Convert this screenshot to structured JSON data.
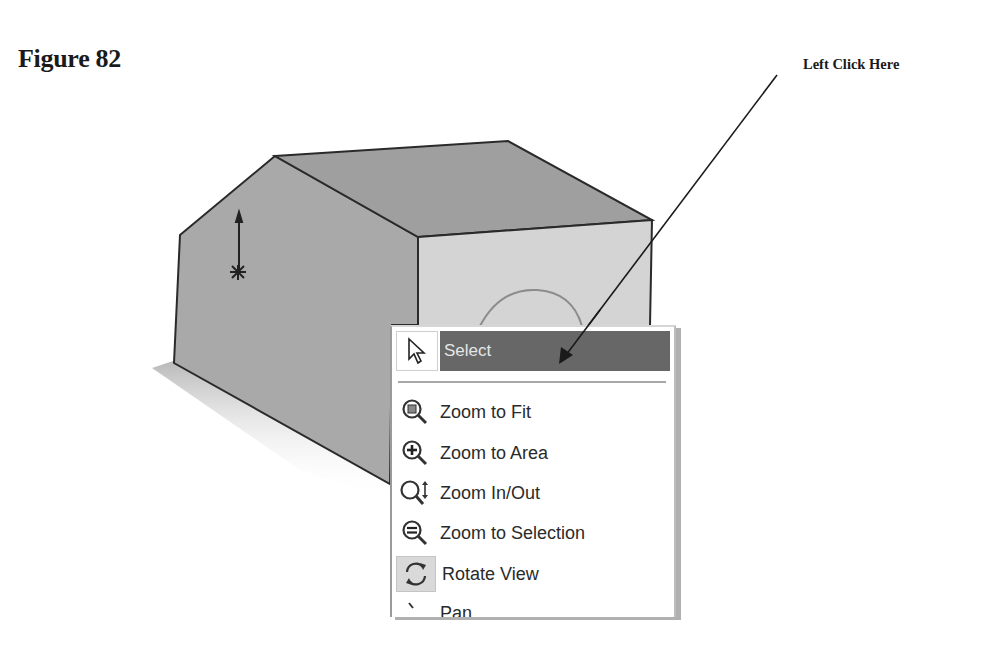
{
  "figure": {
    "title": "Figure 82",
    "callout": "Left Click Here"
  },
  "context_menu": {
    "select": {
      "label": "Select",
      "icon": "pointer-arrow-icon",
      "highlight_color": "#676767"
    },
    "items": [
      {
        "label": "Zoom to Fit",
        "icon": "zoom-to-fit-icon"
      },
      {
        "label": "Zoom to Area",
        "icon": "zoom-to-area-icon"
      },
      {
        "label": "Zoom In/Out",
        "icon": "zoom-in-out-icon"
      },
      {
        "label": "Zoom to Selection",
        "icon": "zoom-to-selection-icon"
      },
      {
        "label": "Rotate View",
        "icon": "rotate-view-icon",
        "active": true
      },
      {
        "label": "Pan",
        "icon": "pan-icon",
        "partially_visible": true
      }
    ]
  },
  "colors": {
    "left_face": "#a9a9a9",
    "top_face": "#9f9f9f",
    "right_face": "#d4d4d4",
    "edge": "#2a2a2a",
    "arc": "#8c8c8c"
  }
}
